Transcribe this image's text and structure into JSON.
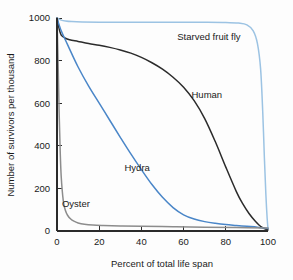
{
  "figure": {
    "background_color": "#fdfdfd",
    "axis_color": "#2b2b2b"
  },
  "chart_data": {
    "type": "line",
    "title": "",
    "subtitle": "",
    "xlabel": "Percent of total life span",
    "ylabel": "Number of survivors per thousand",
    "xlim": [
      0,
      100
    ],
    "ylim": [
      0,
      1000
    ],
    "xticks": [
      0,
      20,
      40,
      60,
      80,
      100
    ],
    "yticks": [
      0,
      200,
      400,
      600,
      800,
      1000
    ],
    "xtick_labels": [
      "0",
      "20",
      "40",
      "60",
      "80",
      "100"
    ],
    "ytick_labels": [
      "0",
      "200",
      "400",
      "600",
      "800",
      "1000"
    ],
    "grid": false,
    "legend": "inline-annotations",
    "legend_position": "none",
    "series": [
      {
        "name": "Starved fruit fly",
        "color": "#9cc3e3",
        "label_x": 72,
        "label_y": 915,
        "x": [
          0,
          1,
          2,
          4,
          7,
          12,
          20,
          30,
          40,
          50,
          60,
          70,
          80,
          86,
          90,
          93,
          95,
          96.5,
          97.5,
          98.3,
          99,
          99.6,
          100
        ],
        "values": [
          1000,
          995,
          990,
          986,
          983,
          981,
          980,
          980,
          980,
          980,
          980,
          980,
          979,
          976,
          968,
          940,
          880,
          760,
          560,
          340,
          170,
          60,
          10
        ]
      },
      {
        "name": "Human",
        "color": "#2b2b2b",
        "label_x": 71,
        "label_y": 640,
        "x": [
          0,
          1,
          2,
          4,
          6,
          10,
          15,
          20,
          25,
          30,
          35,
          40,
          45,
          50,
          55,
          60,
          65,
          70,
          75,
          80,
          85,
          88,
          91,
          94,
          97,
          100
        ],
        "values": [
          1000,
          950,
          920,
          905,
          898,
          890,
          880,
          872,
          862,
          850,
          835,
          815,
          790,
          760,
          722,
          675,
          612,
          528,
          420,
          300,
          185,
          128,
          82,
          46,
          18,
          5
        ]
      },
      {
        "name": "Hydra",
        "color": "#4a86c8",
        "label_x": 38,
        "label_y": 300,
        "x": [
          0,
          2,
          5,
          10,
          15,
          20,
          25,
          30,
          35,
          40,
          45,
          50,
          55,
          60,
          65,
          70,
          75,
          80,
          85,
          90,
          95,
          100
        ],
        "values": [
          1000,
          940,
          875,
          770,
          680,
          600,
          520,
          440,
          362,
          288,
          218,
          158,
          110,
          76,
          56,
          44,
          36,
          30,
          26,
          22,
          18,
          12
        ]
      },
      {
        "name": "Oyster",
        "color": "#8c8c8c",
        "label_x": 9,
        "label_y": 130,
        "x": [
          0,
          0.5,
          1,
          1.5,
          2,
          3,
          4,
          5,
          6.5,
          8,
          10,
          13,
          17,
          22,
          30,
          40,
          55,
          70,
          85,
          100
        ],
        "values": [
          1000,
          800,
          560,
          380,
          255,
          140,
          96,
          74,
          56,
          46,
          38,
          32,
          28,
          26,
          24,
          22,
          20,
          18,
          16,
          14
        ]
      }
    ]
  }
}
